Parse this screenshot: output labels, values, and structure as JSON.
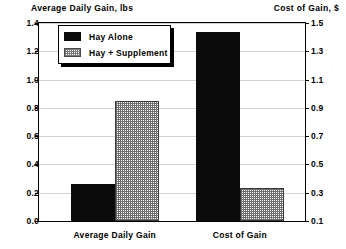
{
  "chart_data": {
    "type": "bar",
    "title": "",
    "categories": [
      "Average Daily Gain",
      "Cost of Gain"
    ],
    "series": [
      {
        "name": "Hay Alone",
        "values": [
          0.26,
          1.44
        ],
        "fill": "solid"
      },
      {
        "name": "Hay + Supplement",
        "values": [
          0.85,
          0.33
        ],
        "fill": "hatch"
      }
    ],
    "axes": {
      "left": {
        "label": "Average Daily Gain, lbs",
        "ticks": [
          "0.0",
          "0.2",
          "0.4",
          "0.6",
          "0.8",
          "1.0",
          "1.2",
          "1.4"
        ],
        "lim": [
          0.0,
          1.4
        ],
        "applies_to_category": "Average Daily Gain"
      },
      "right": {
        "label": "Cost of Gain, $",
        "ticks": [
          "0.1",
          "0.3",
          "0.5",
          "0.7",
          "0.9",
          "1.1",
          "1.3",
          "1.5"
        ],
        "lim": [
          0.1,
          1.5
        ],
        "applies_to_category": "Cost of Gain"
      }
    },
    "grid": true,
    "legend": {
      "position": "upper-left",
      "entries": [
        "Hay Alone",
        "Hay + Supplement"
      ]
    },
    "colors": {
      "solid": "#0b0b0b",
      "hatch": "#6e6e6e",
      "grid": "#d2d2d2",
      "frame": "#000000",
      "background": "#ffffff"
    }
  }
}
